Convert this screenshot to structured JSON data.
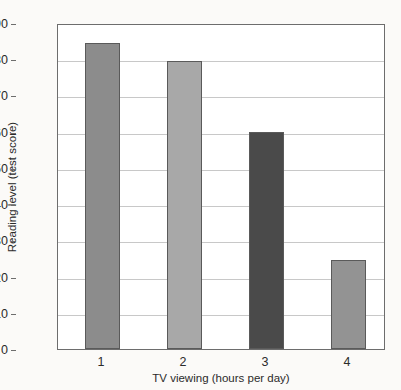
{
  "chart_data": {
    "type": "bar",
    "title": "",
    "xlabel": "TV viewing (hours per day)",
    "ylabel": "Reading level (test score)",
    "categories": [
      "1",
      "2",
      "3",
      "4"
    ],
    "values": [
      84.5,
      79.5,
      60,
      24.5
    ],
    "bar_colors": [
      "#8c8c8c",
      "#a8a8a8",
      "#4a4a4a",
      "#939393"
    ],
    "ylim": [
      0,
      90
    ],
    "yticks": [
      0,
      10,
      20,
      30,
      40,
      50,
      60,
      70,
      80,
      90
    ],
    "ytick_labels": [
      "0",
      "10",
      "20",
      "30",
      "40",
      "50",
      "60",
      "70",
      "80",
      "90"
    ],
    "grid": true,
    "grid_axis": "y",
    "legend": "none",
    "series": [
      {
        "name": "Reading level (test score)",
        "values": [
          84.5,
          79.5,
          60,
          24.5
        ]
      }
    ]
  },
  "style": {
    "frame_color": "#6d6d6d",
    "grid_color": "#c8c8c8",
    "plot_background": "#ffffff",
    "page_background": "#fbfaf8",
    "text_color": "#2b2b2b"
  }
}
